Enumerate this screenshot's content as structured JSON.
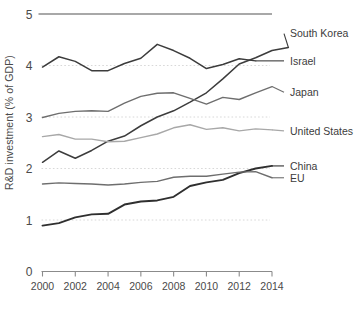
{
  "chart_data": {
    "type": "line",
    "title": "",
    "xlabel": "",
    "ylabel": "R&D investment (% of GDP)",
    "xlim": [
      2000,
      2015
    ],
    "ylim": [
      0,
      5
    ],
    "x": [
      2000,
      2001,
      2002,
      2003,
      2004,
      2005,
      2006,
      2007,
      2008,
      2009,
      2010,
      2011,
      2012,
      2013,
      2014,
      2015
    ],
    "xticks": [
      "2000",
      "2002",
      "2004",
      "2006",
      "2008",
      "2010",
      "2012",
      "2014"
    ],
    "xtick_values": [
      2000,
      2002,
      2004,
      2006,
      2008,
      2010,
      2012,
      2014
    ],
    "yticks": [
      "0",
      "1",
      "2",
      "3",
      "4",
      "5"
    ],
    "ytick_values": [
      0,
      1,
      2,
      3,
      4,
      5
    ],
    "grid": "horizontal-dotted",
    "legend_position": "right-inline-labels",
    "series": [
      {
        "name": "South Korea",
        "color": "#3c3c3c",
        "width": 1.5,
        "label_y": 4.62,
        "values": [
          2.12,
          2.34,
          2.2,
          2.35,
          2.53,
          2.63,
          2.83,
          3.0,
          3.12,
          3.29,
          3.47,
          3.74,
          4.03,
          4.15,
          4.29,
          4.35
        ]
      },
      {
        "name": "Israel",
        "color": "#3c3c3c",
        "width": 1.5,
        "label_y": 4.09,
        "values": [
          3.97,
          4.17,
          4.08,
          3.9,
          3.9,
          4.04,
          4.14,
          4.41,
          4.29,
          4.14,
          3.94,
          4.02,
          4.13,
          4.09,
          null,
          null
        ]
      },
      {
        "name": "Japan",
        "color": "#6e6e6e",
        "width": 1.4,
        "label_y": 3.48,
        "values": [
          2.99,
          3.07,
          3.11,
          3.12,
          3.11,
          3.27,
          3.4,
          3.46,
          3.47,
          3.36,
          3.25,
          3.38,
          3.34,
          3.47,
          3.59,
          null
        ]
      },
      {
        "name": "United States",
        "color": "#a8a8a8",
        "width": 1.4,
        "label_y": 2.73,
        "values": [
          2.62,
          2.66,
          2.57,
          2.57,
          2.52,
          2.53,
          2.6,
          2.67,
          2.79,
          2.85,
          2.76,
          2.79,
          2.73,
          2.77,
          2.75,
          null
        ]
      },
      {
        "name": "China",
        "color": "#2f2f2f",
        "width": 1.9,
        "label_y": 2.05,
        "values": [
          0.89,
          0.94,
          1.05,
          1.11,
          1.12,
          1.3,
          1.36,
          1.38,
          1.45,
          1.66,
          1.73,
          1.78,
          1.91,
          2.0,
          2.05,
          null
        ]
      },
      {
        "name": "EU",
        "color": "#6e6e6e",
        "width": 1.4,
        "label_y": 1.82,
        "values": [
          1.7,
          1.72,
          1.71,
          1.7,
          1.68,
          1.7,
          1.73,
          1.75,
          1.83,
          1.85,
          1.85,
          1.89,
          1.93,
          1.94,
          1.82,
          null
        ]
      }
    ]
  },
  "axis": {
    "ylabel_text": "R&D investment (% of GDP)"
  }
}
